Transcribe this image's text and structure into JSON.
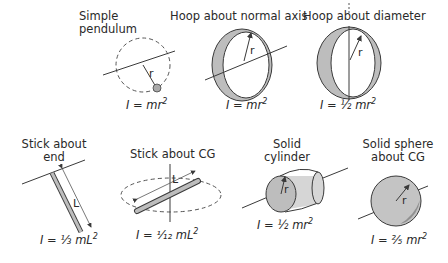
{
  "figure": {
    "type": "moments-of-inertia-reference",
    "panels": [
      {
        "id": "simple-pendulum",
        "title_line1": "Simple",
        "title_line2": "pendulum",
        "formula_prefix": "I = mr",
        "formula_sup": "2",
        "dimension_label": "r"
      },
      {
        "id": "hoop-normal-axis",
        "title_line1": "Hoop about normal axis",
        "formula_prefix": "I = mr",
        "formula_sup": "2",
        "dimension_label": "r"
      },
      {
        "id": "hoop-diameter",
        "title_line1": "Hoop about diameter",
        "formula_prefix": "I = ½ mr",
        "formula_sup": "2",
        "dimension_label": "r"
      },
      {
        "id": "stick-end",
        "title_line1": "Stick about",
        "title_line2": "end",
        "formula_prefix": "I = ⅓ mL",
        "formula_sup": "2",
        "dimension_label": "L"
      },
      {
        "id": "stick-cg",
        "title_line1": "Stick about CG",
        "formula_prefix": "I = ¹⁄₁₂ mL",
        "formula_sup": "2",
        "dimension_label": "L"
      },
      {
        "id": "solid-cylinder",
        "title_line1": "Solid",
        "title_line2": "cylinder",
        "formula_prefix": "I = ½ mr",
        "formula_sup": "2",
        "dimension_label": "r"
      },
      {
        "id": "solid-sphere",
        "title_line1": "Solid sphere",
        "title_line2": "about CG",
        "formula_prefix": "I = ⅖ mr",
        "formula_sup": "2",
        "dimension_label": "r"
      }
    ],
    "colors": {
      "line": "#3a3a3a",
      "fill": "#bdbdbd",
      "shade": "#8c8c8c",
      "text": "#2a2a2a"
    }
  }
}
